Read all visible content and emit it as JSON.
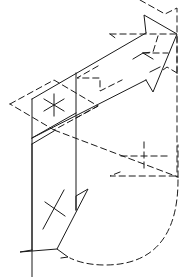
{
  "diagram": {
    "type": "isometric-arrow-drawing",
    "colors": {
      "stroke": "#1a1a1a",
      "background": "#ffffff"
    },
    "parts": [
      {
        "name": "upper-arrow-shaft",
        "style": "solid"
      },
      {
        "name": "upper-arrowhead",
        "style": "solid"
      },
      {
        "name": "hidden-upper-edges",
        "style": "dashed"
      },
      {
        "name": "left-rhombus-face",
        "style": "dashed"
      },
      {
        "name": "asterisk-mark",
        "style": "solid"
      },
      {
        "name": "lower-arrow-shaft",
        "style": "solid"
      },
      {
        "name": "cross-mark-lower",
        "style": "solid"
      },
      {
        "name": "right-notched-face",
        "style": "dashed"
      },
      {
        "name": "cross-mark-right",
        "style": "dashed"
      },
      {
        "name": "curved-sweep",
        "style": "dashed"
      }
    ]
  }
}
